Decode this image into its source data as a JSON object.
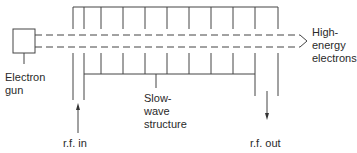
{
  "diagram": {
    "labels": {
      "electron_gun": "Electron\ngun",
      "high_energy_electrons": "High-\nenergy\nelectrons",
      "slow_wave_structure": "Slow-\nwave\nstructure",
      "rf_in": "r.f. in",
      "rf_out": "r.f. out"
    },
    "components": [
      {
        "id": "electron-gun",
        "shape": "box"
      },
      {
        "id": "electron-beam",
        "shape": "dashed-arrow",
        "direction": "right"
      },
      {
        "id": "slow-wave-structure",
        "shape": "vaned-tube",
        "vane_count": 9
      },
      {
        "id": "rf-in-arrow",
        "direction": "up"
      },
      {
        "id": "rf-out-arrow",
        "direction": "down"
      }
    ],
    "colors": {
      "stroke": "#444444",
      "text": "#2a2a2a",
      "background": "#ffffff"
    }
  }
}
